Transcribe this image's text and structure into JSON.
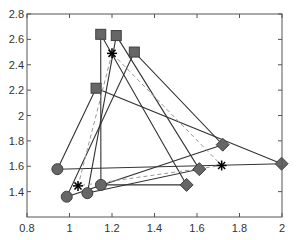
{
  "chart_data": {
    "type": "scatter",
    "title": "",
    "xlabel": "",
    "ylabel": "",
    "xlim": [
      0.8,
      2.0
    ],
    "ylim": [
      1.2,
      2.8
    ],
    "xticks": [
      0.8,
      1,
      1.2,
      1.4,
      1.6,
      1.8,
      2
    ],
    "xtick_labels": [
      "0.8",
      "1",
      "1.2",
      "1.4",
      "1.6",
      "1.8",
      "2"
    ],
    "yticks": [
      1.4,
      1.6,
      1.8,
      2,
      2.2,
      2.4,
      2.6,
      2.8
    ],
    "ytick_labels": [
      "1.4",
      "1.6",
      "1.8",
      "2",
      "2.2",
      "2.4",
      "2.6",
      "2.8"
    ],
    "grid": false,
    "legend": null,
    "marker_color": "#666666",
    "marker_edge_color": "#3f3f3f",
    "line_color": "#333333",
    "mean_line_color": "#999999",
    "series": [
      {
        "name": "squares",
        "marker": "square",
        "points": [
          [
            1.147,
            2.64
          ],
          [
            1.22,
            2.63
          ],
          [
            1.305,
            2.5
          ],
          [
            1.125,
            2.215
          ]
        ]
      },
      {
        "name": "circles",
        "marker": "circle",
        "points": [
          [
            1.148,
            1.453
          ],
          [
            1.084,
            1.388
          ],
          [
            0.987,
            1.36
          ],
          [
            0.943,
            1.577
          ]
        ]
      },
      {
        "name": "diamonds",
        "marker": "diamond",
        "points": [
          [
            1.551,
            1.453
          ],
          [
            1.611,
            1.577
          ],
          [
            1.721,
            1.77
          ],
          [
            1.998,
            1.62
          ]
        ]
      },
      {
        "name": "means",
        "marker": "star",
        "points": [
          [
            1.2,
            2.49
          ],
          [
            1.04,
            1.445
          ],
          [
            1.716,
            1.606
          ]
        ]
      }
    ],
    "triangles": [
      {
        "vertices": [
          [
            1.147,
            2.64
          ],
          [
            1.148,
            1.453
          ],
          [
            1.551,
            1.453
          ]
        ],
        "style": "solid"
      },
      {
        "vertices": [
          [
            1.22,
            2.63
          ],
          [
            1.084,
            1.388
          ],
          [
            1.611,
            1.577
          ]
        ],
        "style": "solid"
      },
      {
        "vertices": [
          [
            1.305,
            2.5
          ],
          [
            0.987,
            1.36
          ],
          [
            1.721,
            1.77
          ]
        ],
        "style": "solid"
      },
      {
        "vertices": [
          [
            1.125,
            2.215
          ],
          [
            0.943,
            1.577
          ],
          [
            1.998,
            1.62
          ]
        ],
        "style": "solid"
      },
      {
        "vertices": [
          [
            1.2,
            2.49
          ],
          [
            1.04,
            1.445
          ],
          [
            1.716,
            1.606
          ]
        ],
        "style": "dashed"
      }
    ]
  },
  "plot_area": {
    "left": 27,
    "top": 14,
    "right": 282,
    "bottom": 217
  }
}
